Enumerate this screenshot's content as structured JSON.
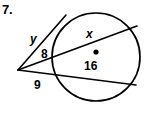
{
  "figure": {
    "problem_number": "7.",
    "stroke_color": "#000000",
    "fill_color": "#ffffff",
    "background_color": "#ffffff",
    "labels": {
      "tangent_y": "y",
      "secant_upper_external_8": "8",
      "secant_lower_external_9": "9",
      "chord_upper_x": "x",
      "chord_lower_16": "16"
    },
    "icons": {
      "center_point": "center-dot"
    }
  }
}
